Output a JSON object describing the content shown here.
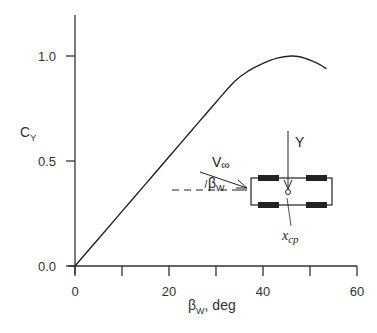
{
  "chart_data": {
    "type": "line",
    "title": "",
    "xlabel": "βw, deg",
    "xlabel_main": "β",
    "xlabel_sub": "W",
    "xlabel_suffix": ", deg",
    "ylabel": "CY",
    "ylabel_main": "C",
    "ylabel_sub": "Y",
    "xlim": [
      0,
      60
    ],
    "ylim": [
      0,
      1.2
    ],
    "x_ticks": [
      0,
      10,
      20,
      30,
      40,
      50,
      60
    ],
    "x_tick_labels": [
      "0",
      "20",
      "40",
      "60"
    ],
    "y_ticks": [
      0.0,
      0.5,
      1.0
    ],
    "y_tick_labels": [
      "0.0",
      "0.5",
      "1.0"
    ],
    "grid": false,
    "legend": null,
    "series": [
      {
        "name": "CY vs βw",
        "x": [
          0,
          5,
          10,
          15,
          20,
          25,
          30,
          34,
          37,
          40,
          43,
          46,
          48,
          50,
          52,
          53.5
        ],
        "y": [
          0.0,
          0.13,
          0.26,
          0.39,
          0.52,
          0.65,
          0.78,
          0.88,
          0.93,
          0.965,
          0.99,
          1.0,
          0.995,
          0.98,
          0.96,
          0.94
        ]
      }
    ],
    "inset": {
      "labels": {
        "velocity_main": "V",
        "velocity_sub": "∞",
        "angle_main": "β",
        "angle_sub": "W",
        "force": "Y",
        "cp_main": "x",
        "cp_sub": "cp"
      },
      "description": "Top view of vehicle with four wheels, crosswind V∞ at angle βw, side force Y acting at center of pressure xcp"
    }
  }
}
